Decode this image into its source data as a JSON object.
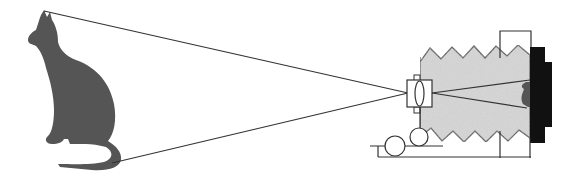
{
  "diagram": {
    "colors": {
      "background": "#ffffff",
      "cat": "#555555",
      "line": "#333333",
      "bellows_fill": "#d9d9d9",
      "camera_back": "#111111",
      "image_on_film": "#555555"
    },
    "elements": {
      "subject": "cat-silhouette",
      "rays": [
        "top-ray",
        "bottom-ray"
      ],
      "camera": [
        "lens-board",
        "lens",
        "bellows",
        "rear-standard",
        "film-back",
        "rail",
        "rollers"
      ]
    }
  }
}
